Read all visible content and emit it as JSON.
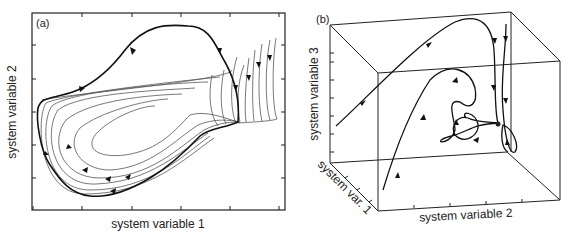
{
  "panels": [
    {
      "id": "a",
      "panel_label": "(a)",
      "xlabel": "system variable 1",
      "ylabel": "system variable 2",
      "description": "2D phase portrait: family of trajectories converging onto a closed limit cycle (bold), with arrows indicating clockwise flow"
    },
    {
      "id": "b",
      "panel_label": "(b)",
      "xlabel": "system variable 2",
      "ylabel": "system variable 3",
      "zlabel": "system var. 1",
      "description": "3D phase space box with trajectories spiraling into a stable fixed point (focus)"
    }
  ]
}
